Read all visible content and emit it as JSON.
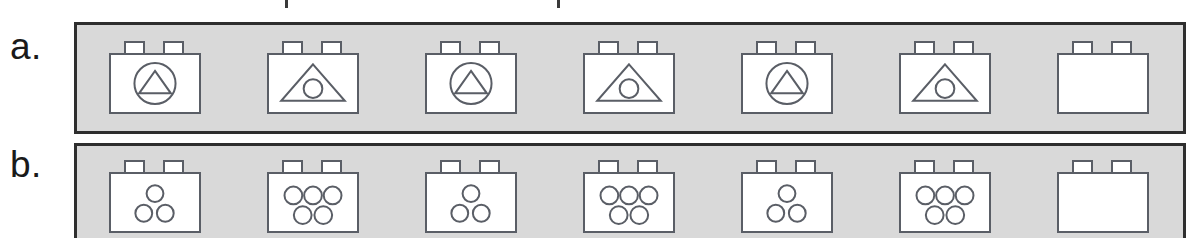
{
  "figure": {
    "background_color": "#ffffff",
    "panel_fill": "#d9d9d9",
    "panel_border_color": "#2e2e2e",
    "brick_fill": "#ffffff",
    "brick_outline_color": "#5a5e66"
  },
  "rows": [
    {
      "label": "a.",
      "name": "row-a",
      "pattern_description": "alternating triangle-inside-circle and circle-inside-triangle",
      "bricks": [
        {
          "index": 1,
          "glyph": "triangle-in-circle",
          "empty": false
        },
        {
          "index": 2,
          "glyph": "circle-in-triangle",
          "empty": false
        },
        {
          "index": 3,
          "glyph": "triangle-in-circle",
          "empty": false
        },
        {
          "index": 4,
          "glyph": "circle-in-triangle",
          "empty": false
        },
        {
          "index": 5,
          "glyph": "triangle-in-circle",
          "empty": false
        },
        {
          "index": 6,
          "glyph": "circle-in-triangle",
          "empty": false
        },
        {
          "index": 7,
          "glyph": "blank",
          "empty": true
        }
      ]
    },
    {
      "label": "b.",
      "name": "row-b",
      "pattern_description": "alternating three dots and five dots",
      "bricks": [
        {
          "index": 1,
          "glyph": "three-dots",
          "dot_count": 3,
          "empty": false
        },
        {
          "index": 2,
          "glyph": "five-dots",
          "dot_count": 5,
          "empty": false
        },
        {
          "index": 3,
          "glyph": "three-dots",
          "dot_count": 3,
          "empty": false
        },
        {
          "index": 4,
          "glyph": "five-dots",
          "dot_count": 5,
          "empty": false
        },
        {
          "index": 5,
          "glyph": "three-dots",
          "dot_count": 3,
          "empty": false
        },
        {
          "index": 6,
          "glyph": "five-dots",
          "dot_count": 5,
          "empty": false
        },
        {
          "index": 7,
          "glyph": "blank",
          "dot_count": 0,
          "empty": true
        }
      ]
    }
  ]
}
